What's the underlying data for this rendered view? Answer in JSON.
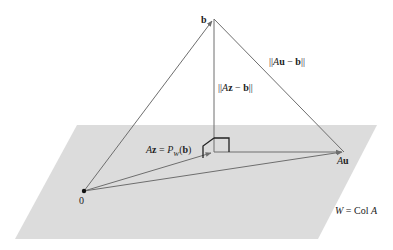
{
  "diagram": {
    "colors": {
      "plane": "#dcdcdc",
      "line": "#6e6e6e",
      "box": "#222222",
      "text": "#222222",
      "origin": "#111111"
    },
    "points": {
      "origin": {
        "label": "0",
        "x": 84,
        "y": 191
      },
      "b": {
        "label": "b",
        "x": 214,
        "y": 19
      },
      "Az": {
        "label": "Az = P_W(b)",
        "x": 214,
        "y": 152
      },
      "Au": {
        "label": "Au",
        "x": 344,
        "y": 152
      }
    },
    "plane": {
      "label": "W = Col A",
      "corners": [
        [
          77,
          125
        ],
        [
          377,
          125
        ],
        [
          318,
          239
        ],
        [
          15,
          239
        ]
      ]
    },
    "labels": {
      "b": "b",
      "origin": "0",
      "au_prefix": "A",
      "au_vec": "u",
      "az_A": "A",
      "az_z": "z",
      "az_eq": " = ",
      "az_P": "P",
      "az_sub": "W",
      "az_arg_open": "(",
      "az_arg": "b",
      "az_arg_close": ")",
      "norm_az_open": "||",
      "norm_az_A": "A",
      "norm_az_z": "z",
      "norm_az_minus": " − ",
      "norm_az_b": "b",
      "norm_az_close": "||",
      "norm_au_open": "||",
      "norm_au_A": "A",
      "norm_au_u": "u",
      "norm_au_minus": " − ",
      "norm_au_b": "b",
      "norm_au_close": "||",
      "plane_W": "W",
      "plane_eq": " = Col ",
      "plane_A": "A"
    }
  }
}
